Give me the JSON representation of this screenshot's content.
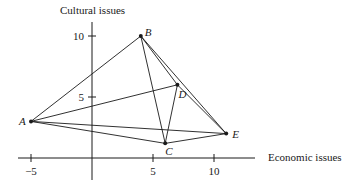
{
  "axes": {
    "y_label": "Cultural issues",
    "x_label": "Economic issues",
    "x_ticks": [
      {
        "value": -5,
        "label": "−5"
      },
      {
        "value": 5,
        "label": "5"
      },
      {
        "value": 10,
        "label": "10"
      }
    ],
    "y_ticks": [
      {
        "value": 5,
        "label": "5"
      },
      {
        "value": 10,
        "label": "10"
      }
    ]
  },
  "points": [
    {
      "id": "A",
      "x": -5,
      "y": 3
    },
    {
      "id": "B",
      "x": 4,
      "y": 10
    },
    {
      "id": "C",
      "x": 6,
      "y": 1.2
    },
    {
      "id": "D",
      "x": 7,
      "y": 6
    },
    {
      "id": "E",
      "x": 11,
      "y": 2
    }
  ],
  "edges": [
    [
      "A",
      "B"
    ],
    [
      "A",
      "D"
    ],
    [
      "A",
      "E"
    ],
    [
      "A",
      "C"
    ],
    [
      "B",
      "C"
    ],
    [
      "B",
      "D"
    ],
    [
      "B",
      "E"
    ],
    [
      "D",
      "C"
    ],
    [
      "D",
      "E"
    ],
    [
      "C",
      "E"
    ]
  ],
  "colors": {
    "ink": "#1a1a1a",
    "background": "#ffffff"
  }
}
